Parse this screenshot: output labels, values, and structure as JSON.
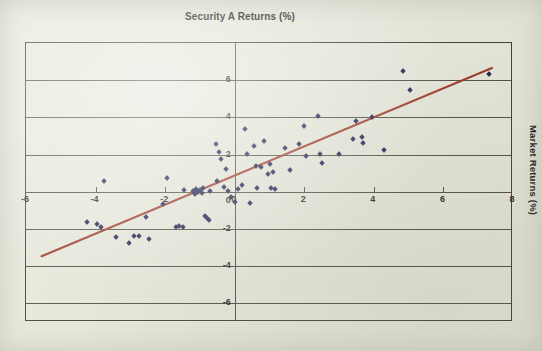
{
  "chart_data": {
    "type": "scatter",
    "title": "Security A Returns (%)",
    "xlabel": "",
    "ylabel": "Market Returns (%)",
    "ylabel_position": "right",
    "grid": true,
    "legend": false,
    "xlim": [
      -6,
      8
    ],
    "ylim": [
      -7,
      8
    ],
    "xticks": [
      -6,
      -4,
      -2,
      0,
      2,
      4,
      6,
      8
    ],
    "xtick_labels": [
      "-6",
      "-4",
      "-2",
      "0",
      "2",
      "4",
      "6",
      "8"
    ],
    "yticks": [
      6,
      4,
      2,
      0,
      -2,
      -4,
      -6
    ],
    "ytick_labels": [
      "6",
      "4",
      "2",
      "0",
      "-2",
      "-4",
      "-6"
    ],
    "point_color": "#1b1b4d",
    "point_marker": "diamond",
    "trendline_color": "#9c3322",
    "background_color": "#e6e8da",
    "axis_color": "#3a3a30",
    "trendline": {
      "x0": -5.55,
      "y0": -3.55,
      "x1": 7.45,
      "y1": 6.65
    },
    "points": [
      [
        -4.25,
        -1.65
      ],
      [
        -3.95,
        -1.75
      ],
      [
        -3.85,
        -1.9
      ],
      [
        -3.75,
        0.6
      ],
      [
        -3.4,
        -2.45
      ],
      [
        -3.05,
        -2.75
      ],
      [
        -2.9,
        -2.4
      ],
      [
        -2.75,
        -2.4
      ],
      [
        -2.55,
        -1.35
      ],
      [
        -2.45,
        -2.55
      ],
      [
        -2.05,
        -0.65
      ],
      [
        -1.95,
        0.75
      ],
      [
        -1.7,
        -1.9
      ],
      [
        -1.6,
        -1.85
      ],
      [
        -1.5,
        -1.9
      ],
      [
        -1.45,
        0.1
      ],
      [
        -1.2,
        0.05
      ],
      [
        -1.15,
        -0.1
      ],
      [
        -1.1,
        0.15
      ],
      [
        -1.05,
        0.0
      ],
      [
        -1.0,
        0.1
      ],
      [
        -0.95,
        -0.05
      ],
      [
        -0.9,
        0.2
      ],
      [
        -0.85,
        -1.3
      ],
      [
        -0.8,
        -1.4
      ],
      [
        -0.75,
        -1.5
      ],
      [
        -0.7,
        0.05
      ],
      [
        -0.55,
        2.55
      ],
      [
        -0.5,
        0.6
      ],
      [
        -0.45,
        2.15
      ],
      [
        -0.4,
        1.75
      ],
      [
        -0.3,
        0.25
      ],
      [
        -0.25,
        1.25
      ],
      [
        -0.2,
        0.05
      ],
      [
        -0.1,
        -0.3
      ],
      [
        0.0,
        -0.55
      ],
      [
        0.1,
        0.15
      ],
      [
        0.2,
        0.35
      ],
      [
        0.3,
        3.35
      ],
      [
        0.35,
        2.05
      ],
      [
        0.45,
        -0.6
      ],
      [
        0.55,
        2.45
      ],
      [
        0.6,
        1.4
      ],
      [
        0.65,
        0.2
      ],
      [
        0.75,
        1.35
      ],
      [
        0.85,
        2.75
      ],
      [
        0.95,
        0.95
      ],
      [
        1.0,
        1.5
      ],
      [
        1.05,
        0.2
      ],
      [
        1.1,
        1.05
      ],
      [
        1.15,
        0.15
      ],
      [
        1.45,
        2.35
      ],
      [
        1.6,
        1.15
      ],
      [
        1.85,
        2.55
      ],
      [
        2.0,
        3.55
      ],
      [
        2.05,
        1.95
      ],
      [
        2.4,
        4.1
      ],
      [
        2.45,
        2.05
      ],
      [
        2.5,
        1.55
      ],
      [
        3.0,
        2.05
      ],
      [
        3.4,
        2.85
      ],
      [
        3.5,
        3.8
      ],
      [
        3.65,
        2.95
      ],
      [
        3.7,
        2.65
      ],
      [
        3.95,
        4.0
      ],
      [
        4.3,
        2.25
      ],
      [
        4.85,
        6.5
      ],
      [
        5.05,
        5.5
      ],
      [
        7.3,
        6.35
      ]
    ]
  }
}
